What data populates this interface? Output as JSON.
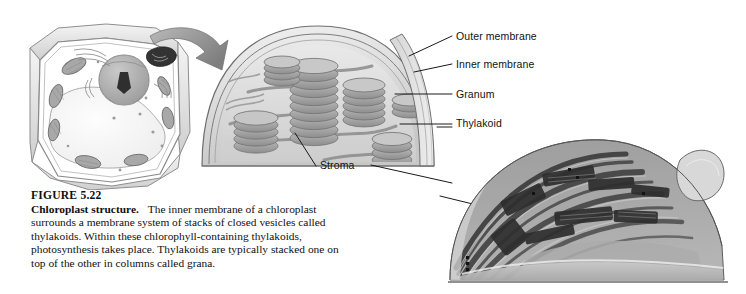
{
  "figure": {
    "number_label": "FIGURE 5.22",
    "title": "Chloroplast structure.",
    "caption_body": "The inner membrane of a chloroplast surrounds a membrane system of stacks of closed vesicles called thylakoids. Within these chlorophyll-containing thylakoids, photosynthesis takes place. Thylakoids are typically stacked one on top of the other in columns called grana."
  },
  "labels": {
    "outer_membrane": "Outer membrane",
    "inner_membrane": "Inner membrane",
    "granum": "Granum",
    "thylakoid": "Thylakoid",
    "stroma": "Stroma"
  },
  "panels": {
    "plant_cell": "plant-cell-illustration",
    "chloroplast_diagram": "chloroplast-cutaway-diagram",
    "micrograph": "chloroplast-electron-micrograph",
    "zoom_arrow": "magnification-arrow"
  },
  "colors": {
    "ink": "#111111",
    "leader_line": "#1a1a1a",
    "diagram_mid_gray": "#9a9a9a",
    "diagram_light_gray": "#d9d9d9",
    "diagram_dark_gray": "#6e6e6e",
    "micrograph_dark": "#3a3a3a",
    "micrograph_mid": "#8d8d8d",
    "background": "#ffffff"
  }
}
